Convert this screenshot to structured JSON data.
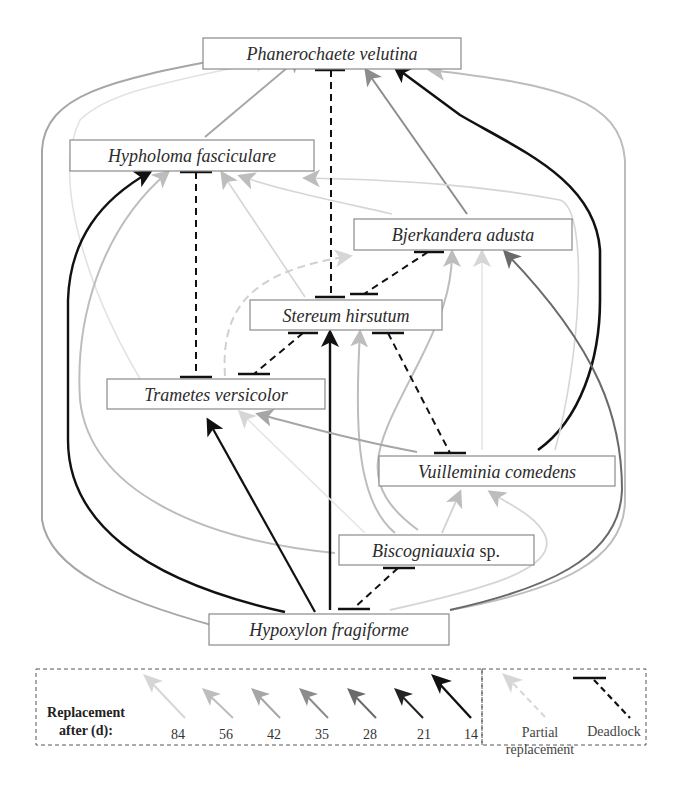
{
  "colors": {
    "d84": "#d6d6d6",
    "d56": "#bdbdbd",
    "d42": "#a6a6a6",
    "d35": "#8c8c8c",
    "d28": "#6a6a6a",
    "d21": "#3a3a3a",
    "d14": "#111111",
    "partial": "#d8d8d8",
    "deadlock": "#111111"
  },
  "nodes": {
    "phanerochaete": {
      "label": "Phanerochaete velutina"
    },
    "hypholoma": {
      "label": "Hypholoma fasciculare"
    },
    "bjerkandera": {
      "label": "Bjerkandera adusta"
    },
    "stereum": {
      "label": "Stereum hirsutum"
    },
    "trametes": {
      "label": "Trametes versicolor"
    },
    "vuilleminia": {
      "label": "Vuilleminia comedens"
    },
    "biscogniauxia": {
      "label": "Biscogniauxia",
      "suffix": " sp."
    },
    "hypoxylon": {
      "label": "Hypoxylon fragiforme"
    }
  },
  "legend": {
    "title_line1": "Replacement",
    "title_line2": "after (d):",
    "days": [
      "84",
      "56",
      "42",
      "35",
      "28",
      "21",
      "14"
    ],
    "partial_line1": "Partial",
    "partial_line2": "replacement",
    "deadlock": "Deadlock"
  },
  "edges": [
    {
      "from": "Hypholoma fasciculare",
      "to": "Phanerochaete velutina",
      "days": "42"
    },
    {
      "from": "Hypoxylon fragiforme",
      "to": "Phanerochaete velutina",
      "days": "42"
    },
    {
      "from": "Trametes versicolor",
      "to": "Phanerochaete velutina",
      "days": "84"
    },
    {
      "from": "Bjerkandera adusta",
      "to": "Phanerochaete velutina",
      "days": "35"
    },
    {
      "from": "Vuilleminia comedens",
      "to": "Phanerochaete velutina",
      "days": "14"
    },
    {
      "from": "Hypoxylon fragiforme",
      "to": "Phanerochaete velutina (right)",
      "days": "56"
    },
    {
      "from": "Hypoxylon fragiforme",
      "to": "Hypholoma fasciculare",
      "days": "14"
    },
    {
      "from": "Biscogniauxia sp.",
      "to": "Hypholoma fasciculare",
      "days": "56"
    },
    {
      "from": "Stereum hirsutum",
      "to": "Hypholoma fasciculare",
      "days": "84"
    },
    {
      "from": "Bjerkandera adusta",
      "to": "Hypholoma fasciculare",
      "days": "84"
    },
    {
      "from": "Vuilleminia comedens",
      "to": "Hypholoma fasciculare",
      "days": "84"
    },
    {
      "from": "Trametes versicolor",
      "to": "Bjerkandera adusta",
      "days": "partial"
    },
    {
      "from": "Biscogniauxia sp.",
      "to": "Bjerkandera adusta",
      "days": "56"
    },
    {
      "from": "Vuilleminia comedens",
      "to": "Bjerkandera adusta",
      "days": "84"
    },
    {
      "from": "Hypoxylon fragiforme",
      "to": "Bjerkandera adusta",
      "days": "28"
    },
    {
      "from": "Hypoxylon fragiforme",
      "to": "Stereum hirsutum",
      "days": "14"
    },
    {
      "from": "Biscogniauxia sp.",
      "to": "Stereum hirsutum",
      "days": "56"
    },
    {
      "from": "Hypoxylon fragiforme",
      "to": "Trametes versicolor",
      "days": "14"
    },
    {
      "from": "Biscogniauxia sp.",
      "to": "Trametes versicolor",
      "days": "84"
    },
    {
      "from": "Vuilleminia comedens",
      "to": "Trametes versicolor",
      "days": "42"
    },
    {
      "from": "Biscogniauxia sp.",
      "to": "Vuilleminia comedens",
      "days": "84"
    },
    {
      "from": "Hypoxylon fragiforme",
      "to": "Vuilleminia comedens",
      "days": "84"
    }
  ],
  "deadlocks": [
    {
      "a": "Phanerochaete velutina",
      "b": "Stereum hirsutum"
    },
    {
      "a": "Hypholoma fasciculare",
      "b": "Trametes versicolor"
    },
    {
      "a": "Bjerkandera adusta",
      "b": "Stereum hirsutum"
    },
    {
      "a": "Stereum hirsutum",
      "b": "Trametes versicolor"
    },
    {
      "a": "Stereum hirsutum",
      "b": "Vuilleminia comedens"
    },
    {
      "a": "Biscogniauxia sp.",
      "b": "Hypoxylon fragiforme"
    }
  ]
}
